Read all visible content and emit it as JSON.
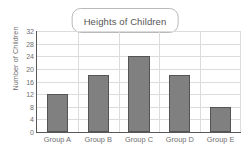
{
  "chart_data": {
    "type": "bar",
    "title": "Heights of Children",
    "xlabel": "",
    "ylabel": "Number of Children",
    "categories": [
      "Group A",
      "Group B",
      "Group C",
      "Group D",
      "Group E"
    ],
    "values": [
      12,
      18,
      24,
      18,
      8
    ],
    "ylim": [
      0,
      32
    ],
    "yticks": [
      0,
      4,
      8,
      12,
      16,
      20,
      24,
      28,
      32
    ],
    "ytick_labels": [
      "0",
      "4",
      "8",
      "12",
      "16",
      "20",
      "24",
      "28",
      "32"
    ],
    "grid": true,
    "legend": null,
    "bar_color": "#808080",
    "bar_edge_color": "#545454",
    "grid_color": "#dcdcdc",
    "axis_color": "#585858",
    "background_color": "#ffffff"
  }
}
